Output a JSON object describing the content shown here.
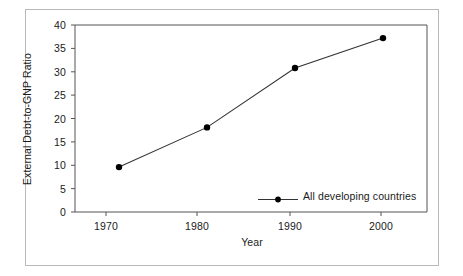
{
  "chart_data": {
    "type": "line",
    "title": "",
    "xlabel": "Year",
    "ylabel": "External Debt-to-GNP Ratio",
    "x": [
      1970,
      1980,
      1990,
      2000
    ],
    "xtick_labels": [
      "1970",
      "1980",
      "1990",
      "2000"
    ],
    "ytick_labels": [
      "0",
      "5",
      "10",
      "15",
      "20",
      "25",
      "30",
      "35",
      "40"
    ],
    "yticks": [
      0,
      5,
      10,
      15,
      20,
      25,
      30,
      35,
      40
    ],
    "xlim": [
      1965,
      2005
    ],
    "ylim": [
      0,
      40
    ],
    "grid": false,
    "legend_position": "bottom-right",
    "series": [
      {
        "name": "All developing countries",
        "values": [
          9.6,
          18.1,
          30.8,
          37.2
        ],
        "marker": "filled-circle",
        "color": "#000000"
      }
    ]
  },
  "legend": {
    "entries": [
      {
        "label": "All developing countries",
        "marker": "filled-circle-marker"
      }
    ]
  },
  "axes": {
    "x_title": "Year",
    "y_title": "External Debt-to-GNP Ratio"
  },
  "style": {
    "line_color": "#333333",
    "marker_color": "#000000",
    "axis_color": "#555555",
    "frame_color": "#b9b9b9",
    "text_color": "#1a1a1a",
    "background": "#ffffff"
  }
}
